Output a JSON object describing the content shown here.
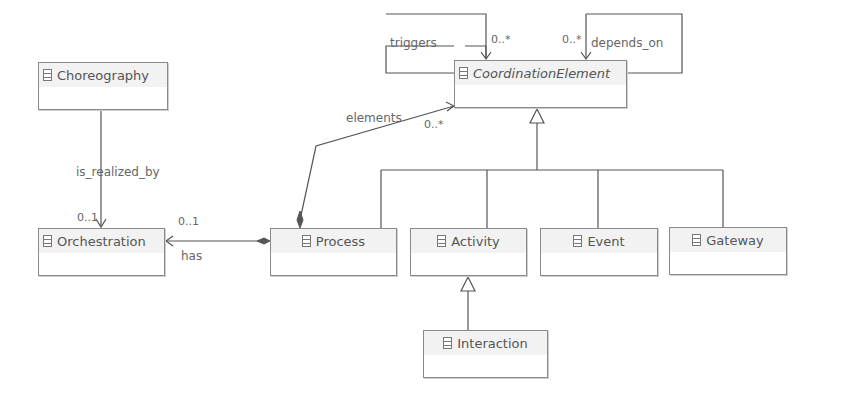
{
  "diagram": {
    "type": "UML class diagram",
    "classes": [
      {
        "id": "coordination_element",
        "name": "CoordinationElement",
        "abstract": true
      },
      {
        "id": "choreography",
        "name": "Choreography"
      },
      {
        "id": "orchestration",
        "name": "Orchestration"
      },
      {
        "id": "process",
        "name": "Process"
      },
      {
        "id": "activity",
        "name": "Activity"
      },
      {
        "id": "event",
        "name": "Event"
      },
      {
        "id": "gateway",
        "name": "Gateway"
      },
      {
        "id": "interaction",
        "name": "Interaction"
      }
    ],
    "associations": {
      "triggers": {
        "label": "triggers",
        "multiplicity": "0..*"
      },
      "depends_on": {
        "label": "depends_on",
        "multiplicity": "0..*"
      },
      "elements": {
        "label": "elements",
        "multiplicity": "0..*"
      },
      "is_realized_by": {
        "label": "is_realized_by",
        "multiplicity": "0..1"
      },
      "has": {
        "label": "has",
        "multiplicity": "0..1"
      }
    },
    "generalizations": [
      {
        "child": "Process",
        "parent": "CoordinationElement"
      },
      {
        "child": "Activity",
        "parent": "CoordinationElement"
      },
      {
        "child": "Event",
        "parent": "CoordinationElement"
      },
      {
        "child": "Gateway",
        "parent": "CoordinationElement"
      },
      {
        "child": "Interaction",
        "parent": "Activity"
      }
    ],
    "colors": {
      "line": "#555555",
      "box_border": "#8a8a8a",
      "text": "#555555"
    }
  }
}
